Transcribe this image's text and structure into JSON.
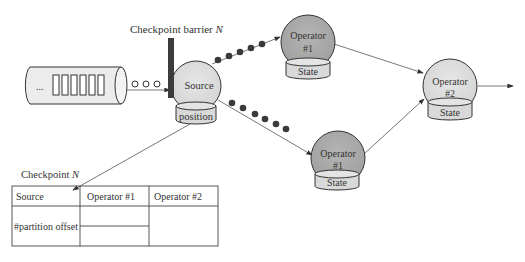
{
  "diagram": {
    "type": "checkpoint-barrier-dataflow",
    "barrier_label": "Checkpoint barrier",
    "barrier_var": "N",
    "queue": {
      "ellipsis": "...",
      "record_count": 6
    },
    "source": {
      "label": "Source",
      "store_label": "position"
    },
    "operators": [
      {
        "id": "op1-top",
        "label_line1": "Operator",
        "label_line2": "#1",
        "store_label": "State"
      },
      {
        "id": "op1-bottom",
        "label_line1": "Operator",
        "label_line2": "#1",
        "store_label": "State"
      },
      {
        "id": "op2",
        "label_line1": "Operator",
        "label_line2": "#2",
        "store_label": "State"
      }
    ],
    "checkpoint_table": {
      "title": "Checkpoint",
      "title_var": "N",
      "headers": [
        "Source",
        "Operator #1",
        "Operator #2"
      ],
      "source_cell": "#partition offset"
    },
    "colors": {
      "dark_node": "#a9a9a9",
      "light_node": "#dcdcdc",
      "store_fill": "#d9d9d9",
      "barrier": "#3c3c3c",
      "record_dot": "#3a3a3a",
      "line": "#555555"
    },
    "edges": [
      {
        "from": "queue",
        "to": "source"
      },
      {
        "from": "source",
        "to": "op1-top"
      },
      {
        "from": "source",
        "to": "op1-bottom"
      },
      {
        "from": "op1-top",
        "to": "op2"
      },
      {
        "from": "op1-bottom",
        "to": "op2"
      },
      {
        "from": "op2",
        "to": "output"
      },
      {
        "from": "source.position",
        "to": "checkpoint_table.source"
      }
    ]
  }
}
